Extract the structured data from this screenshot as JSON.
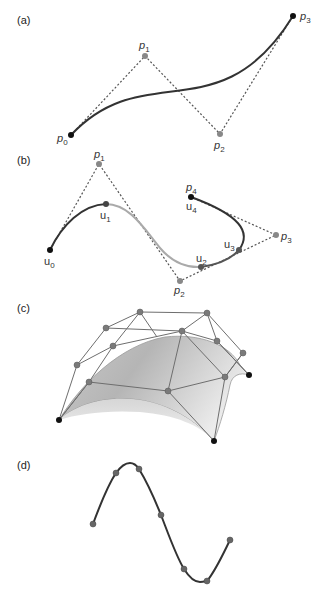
{
  "panels": {
    "a": {
      "label": "(a)",
      "points": [
        {
          "name": "p",
          "sub": "0",
          "x": 71,
          "y": 135,
          "color": "#111111"
        },
        {
          "name": "p",
          "sub": "1",
          "x": 145,
          "y": 56,
          "color": "#888888"
        },
        {
          "name": "p",
          "sub": "2",
          "x": 220,
          "y": 134,
          "color": "#888888"
        },
        {
          "name": "p",
          "sub": "3",
          "x": 293,
          "y": 16,
          "color": "#111111"
        }
      ]
    },
    "b": {
      "label": "(b)",
      "control_points": [
        {
          "name": "p",
          "sub": "1",
          "x": 99,
          "y": 164
        },
        {
          "name": "p",
          "sub": "2",
          "x": 180,
          "y": 281
        },
        {
          "name": "p",
          "sub": "3",
          "x": 276,
          "y": 235
        },
        {
          "name": "p",
          "sub": "4",
          "x": 191,
          "y": 197
        }
      ],
      "knots": [
        {
          "name": "u",
          "sub": "0",
          "x": 50,
          "y": 250
        },
        {
          "name": "u",
          "sub": "1",
          "x": 106,
          "y": 204
        },
        {
          "name": "u",
          "sub": "2",
          "x": 201,
          "y": 267
        },
        {
          "name": "u",
          "sub": "3",
          "x": 239,
          "y": 250
        },
        {
          "name": "u",
          "sub": "4",
          "x": 191,
          "y": 197
        }
      ]
    },
    "c": {
      "label": "(c)"
    },
    "d": {
      "label": "(d)",
      "points": [
        {
          "x": 93,
          "y": 524
        },
        {
          "x": 116,
          "y": 473
        },
        {
          "x": 139,
          "y": 469
        },
        {
          "x": 161,
          "y": 515
        },
        {
          "x": 184,
          "y": 569
        },
        {
          "x": 207,
          "y": 581
        },
        {
          "x": 230,
          "y": 540
        }
      ]
    }
  },
  "labels": {
    "a_p0": "p",
    "a_p0_sub": "0",
    "a_p1": "p",
    "a_p1_sub": "1",
    "a_p2": "p",
    "a_p2_sub": "2",
    "a_p3": "p",
    "a_p3_sub": "3",
    "b_p1": "p",
    "b_p1_sub": "1",
    "b_p2": "p",
    "b_p2_sub": "2",
    "b_p3": "p",
    "b_p3_sub": "3",
    "b_p4": "p",
    "b_p4_sub": "4",
    "b_u0": "u",
    "b_u0_sub": "0",
    "b_u1": "u",
    "b_u1_sub": "1",
    "b_u2": "u",
    "b_u2_sub": "2",
    "b_u3": "u",
    "b_u3_sub": "3",
    "b_u4": "u",
    "b_u4_sub": "4"
  },
  "colors": {
    "curve_dark": "#333333",
    "curve_light": "#aaaaaa",
    "control_point": "#808080",
    "endpoint": "#111111",
    "dotted": "#555555",
    "surface_light": "#e6e6e6",
    "surface_dark": "#b8b8b8"
  }
}
